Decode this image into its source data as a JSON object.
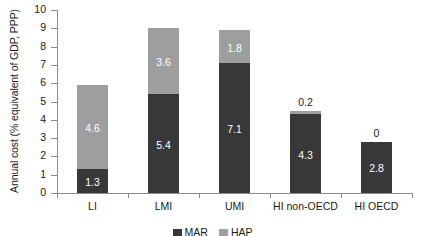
{
  "chart_data": {
    "type": "bar",
    "subtype": "stacked-vertical",
    "title": "",
    "xlabel": "",
    "ylabel": "Annual cost (% equivalent of GDP, PPP)",
    "ylim": [
      0,
      10
    ],
    "ytick_step": 1,
    "ytick_labels": [
      "10",
      "9",
      "8",
      "7",
      "6",
      "5",
      "4",
      "3",
      "2",
      "1",
      "0"
    ],
    "grid": false,
    "legend_position": "bottom-center",
    "categories": [
      "LI",
      "LMI",
      "UMI",
      "HI non-OECD",
      "HI OECD"
    ],
    "series": [
      {
        "name": "MAR",
        "color": "#383838",
        "values": [
          1.3,
          5.4,
          7.1,
          4.3,
          2.8
        ],
        "value_labels": [
          "1.3",
          "5.4",
          "7.1",
          "4.3",
          "2.8"
        ],
        "label_placement": [
          "inside",
          "inside",
          "inside",
          "inside",
          "inside"
        ]
      },
      {
        "name": "HAP",
        "color": "#9e9e9e",
        "values": [
          4.6,
          3.6,
          1.8,
          0.2,
          0
        ],
        "value_labels": [
          "4.6",
          "3.6",
          "1.8",
          "0.2",
          "0"
        ],
        "label_placement": [
          "inside",
          "inside",
          "inside",
          "above",
          "above"
        ]
      }
    ],
    "totals": [
      5.9,
      9.0,
      8.9,
      4.5,
      2.8
    ]
  },
  "legend": {
    "items": [
      {
        "label": "MAR",
        "color": "#383838"
      },
      {
        "label": "HAP",
        "color": "#9e9e9e"
      }
    ]
  },
  "colors": {
    "series_dark": "#383838",
    "series_light": "#9e9e9e",
    "axis": "#8c8c8c",
    "text": "#1a1a1a",
    "label_on_bar": "#ffffff",
    "background": "#ffffff"
  }
}
